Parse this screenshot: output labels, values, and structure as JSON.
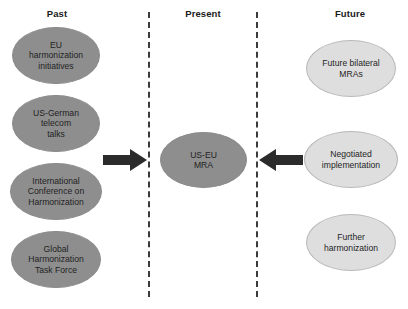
{
  "diagram": {
    "title_columns": [
      {
        "id": "past",
        "label": "Past"
      },
      {
        "id": "present",
        "label": "Present"
      },
      {
        "id": "future",
        "label": "Future"
      }
    ],
    "past_nodes": [
      {
        "id": "eu-harmonization-initiatives",
        "label": "EU\nharmonization\ninitiatives"
      },
      {
        "id": "us-german-telecom-talks",
        "label": "US-German\ntelecom\ntalks"
      },
      {
        "id": "international-conference-on-harmonization",
        "label": "International\nConference on\nHarmonization"
      },
      {
        "id": "global-harmonization-task-force",
        "label": "Global\nHarmonization\nTask Force"
      }
    ],
    "present_nodes": [
      {
        "id": "us-eu-mra",
        "label": "US-EU\nMRA"
      }
    ],
    "future_nodes": [
      {
        "id": "future-bilateral-mras",
        "label": "Future bilateral\nMRAs"
      },
      {
        "id": "negotiated-implementation",
        "label": "Negotiated\nimplementation"
      },
      {
        "id": "further-harmonization",
        "label": "Further\nharmonization"
      }
    ],
    "arrows": [
      {
        "id": "arrow-past-to-present",
        "direction": "right"
      },
      {
        "id": "arrow-future-to-present",
        "direction": "left"
      }
    ],
    "colors": {
      "past_fill": "#8e8e8e",
      "present_fill": "#8e8e8e",
      "future_fill": "#dedede",
      "divider": "#3b3b3b",
      "arrow": "#2b2b2b",
      "text": "#1f1f1f"
    }
  }
}
